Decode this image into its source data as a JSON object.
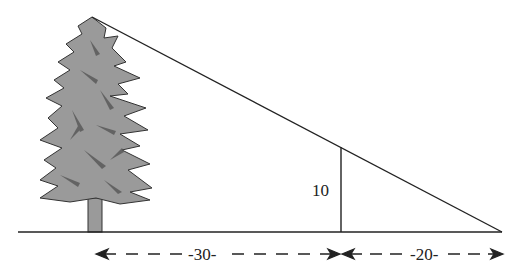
{
  "diagram": {
    "type": "similar-triangles-tree-shadow",
    "labels": {
      "pole_height": "10",
      "tree_to_pole_distance": "-30-",
      "pole_to_tip_distance": "-20-"
    },
    "colors": {
      "line": "#222222",
      "tree_fill": "#9a9a9a",
      "tree_dark": "#555555",
      "background": "#ffffff"
    }
  }
}
